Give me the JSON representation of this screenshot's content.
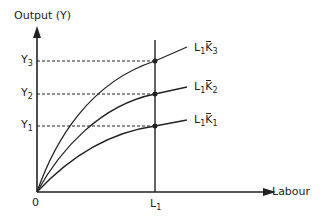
{
  "diagram": {
    "y_axis_label": "Output (Y)",
    "x_axis_label": "Labour",
    "origin_label": "0",
    "x_marker": {
      "base": "L",
      "sub": "1"
    },
    "y_levels": [
      {
        "base": "Y",
        "sub": "3"
      },
      {
        "base": "Y",
        "sub": "2"
      },
      {
        "base": "Y",
        "sub": "1"
      }
    ],
    "curves": [
      {
        "l": "L",
        "l_sub": "1",
        "k": "K",
        "k_sub": "3"
      },
      {
        "l": "L",
        "l_sub": "1",
        "k": "K",
        "k_sub": "2"
      },
      {
        "l": "L",
        "l_sub": "1",
        "k": "K",
        "k_sub": "1"
      }
    ],
    "line_color": "#222222"
  }
}
